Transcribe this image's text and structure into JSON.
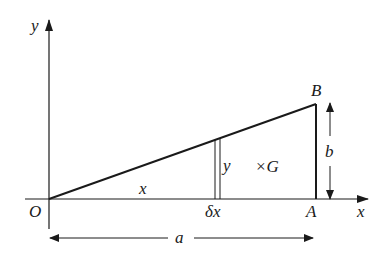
{
  "diagram": {
    "axes": {
      "x_label": "x",
      "y_label": "y",
      "origin_label": "O"
    },
    "points": {
      "O": "O",
      "A": "A",
      "B": "B",
      "G": "G"
    },
    "labels": {
      "strip_distance": "x",
      "strip_height": "y",
      "strip_width": "δx",
      "centroid": "×G",
      "height": "b",
      "base": "a"
    },
    "stroke_color": "#1a1a1a"
  }
}
